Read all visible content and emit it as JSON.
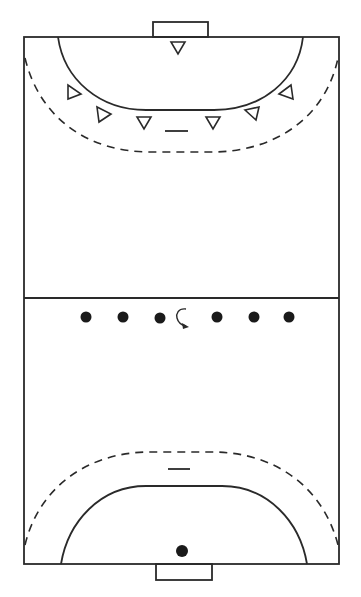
{
  "diagram": {
    "title": "Handball court: 6-0 defense vs attacking formation",
    "court": {
      "left": 24,
      "right": 339,
      "top": 37,
      "bottom": 564,
      "center_line_y": 298
    },
    "colors": {
      "line": "#2a2a2a",
      "player_fill": "#1a1a1a",
      "background": "#ffffff"
    },
    "top_half": {
      "goal": {
        "x1": 153,
        "x2": 208,
        "y1": 22,
        "y2": 37
      },
      "goal_area_line": "6m solid arc",
      "free_throw_line": "9m dashed arc",
      "seven_meter_mark": {
        "x1": 165,
        "x2": 188,
        "y": 131
      },
      "defenders": [
        {
          "role": "goalkeeper",
          "x": 178,
          "y": 47,
          "shape": "triangle",
          "direction": "down"
        },
        {
          "role": "left-wing-defender",
          "x": 73,
          "y": 92,
          "shape": "triangle",
          "direction": "right"
        },
        {
          "role": "left-back-defender",
          "x": 102,
          "y": 115,
          "shape": "triangle",
          "direction": "right"
        },
        {
          "role": "left-center-defender",
          "x": 144,
          "y": 123,
          "shape": "triangle",
          "direction": "down"
        },
        {
          "role": "right-center-defender",
          "x": 213,
          "y": 123,
          "shape": "triangle",
          "direction": "down"
        },
        {
          "role": "right-back-defender",
          "x": 253,
          "y": 113,
          "shape": "triangle",
          "direction": "down-left"
        },
        {
          "role": "right-wing-defender",
          "x": 287,
          "y": 92,
          "shape": "triangle",
          "direction": "left"
        }
      ]
    },
    "center": {
      "attackers": [
        {
          "x": 86,
          "y": 317
        },
        {
          "x": 123,
          "y": 317
        },
        {
          "x": 160,
          "y": 318
        },
        {
          "x": 217,
          "y": 317
        },
        {
          "x": 254,
          "y": 317
        },
        {
          "x": 289,
          "y": 317
        }
      ],
      "movement_arrow": {
        "type": "rotate-arrow",
        "x": 182,
        "y": 318
      }
    },
    "bottom_half": {
      "goal": {
        "x1": 156,
        "x2": 212,
        "y1": 564,
        "y2": 580
      },
      "goal_area_line": "6m solid arc",
      "free_throw_line": "9m dashed arc",
      "seven_meter_mark": {
        "x1": 168,
        "x2": 190,
        "y": 469
      },
      "goalkeeper": {
        "x": 182,
        "y": 551,
        "shape": "dot"
      }
    }
  }
}
